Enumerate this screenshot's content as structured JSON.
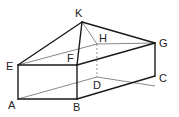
{
  "diagram": {
    "type": "geometric-solid",
    "vertices": {
      "A": {
        "label": "A",
        "x": 18,
        "y": 99
      },
      "B": {
        "label": "B",
        "x": 77,
        "y": 99
      },
      "C": {
        "label": "C",
        "x": 155,
        "y": 86
      },
      "D": {
        "label": "D",
        "x": 97,
        "y": 77
      },
      "E": {
        "label": "E",
        "x": 18,
        "y": 65
      },
      "F": {
        "label": "F",
        "x": 77,
        "y": 65
      },
      "G": {
        "label": "G",
        "x": 155,
        "y": 43
      },
      "H": {
        "label": "H",
        "x": 97,
        "y": 44
      },
      "K": {
        "label": "K",
        "x": 82,
        "y": 22
      }
    },
    "edges_visible": [
      "AB",
      "BC",
      "CG",
      "AE",
      "BF",
      "EF",
      "FG",
      "EK",
      "FK",
      "GK"
    ],
    "edges_thin": [
      "AD",
      "DC",
      "EH",
      "HG",
      "KH"
    ],
    "edges_dashed": [
      "HD"
    ],
    "labels": {
      "K": "K",
      "H": "H",
      "G": "G",
      "E": "E",
      "F": "F",
      "C": "C",
      "D": "D",
      "A": "A",
      "B": "B"
    }
  }
}
